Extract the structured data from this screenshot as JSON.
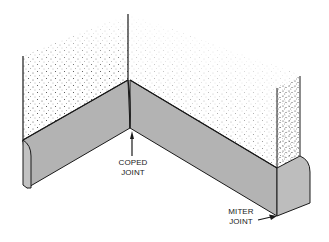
{
  "diagram": {
    "colors": {
      "baseboard_fill": "#b3b3b3",
      "baseboard_end_fill": "#bdbdbd",
      "outline": "#1a1a1a",
      "wall_stipple": "#333333",
      "background": "#ffffff"
    },
    "labels": {
      "coped": {
        "line1": "COPED",
        "line2": "JOINT"
      },
      "miter": {
        "line1": "MITER",
        "line2": "JOINT"
      }
    }
  }
}
